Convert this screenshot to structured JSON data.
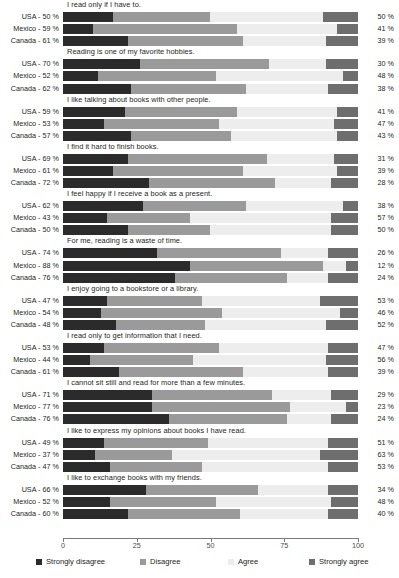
{
  "chart_data": {
    "type": "bar",
    "subtype": "stacked-horizontal-diverging-likert",
    "title": "",
    "xlabel": "",
    "ylabel": "",
    "xlim": [
      0,
      100
    ],
    "xticks": [
      0,
      25,
      50,
      75,
      100
    ],
    "xtick_labels": [
      "0",
      "25",
      "50",
      "75",
      "100"
    ],
    "grid": false,
    "legend_position": "bottom",
    "legend": [
      {
        "key": "strongly_disagree",
        "label": "Strongly disagree",
        "color": "#2b2b2b"
      },
      {
        "key": "disagree",
        "label": "Disagree",
        "color": "#9a9a9a"
      },
      {
        "key": "agree",
        "label": "Agree",
        "color": "#ededed"
      },
      {
        "key": "strongly_agree",
        "label": "Strongly agree",
        "color": "#6e6e6e"
      }
    ],
    "categories": [
      "Strongly disagree",
      "Disagree",
      "Agree",
      "Strongly agree"
    ],
    "countries": [
      "USA",
      "Mexico",
      "Canada"
    ],
    "groups": [
      {
        "statement": "I read only if I have to.",
        "rows": [
          {
            "country": "USA",
            "left_label": "USA - 50 %",
            "right_label": "50 %",
            "disagree_total": 50,
            "agree_total": 50,
            "values": [
              17,
              33,
              38,
              12
            ]
          },
          {
            "country": "Mexico",
            "left_label": "Mexico - 59 %",
            "right_label": "41 %",
            "disagree_total": 59,
            "agree_total": 41,
            "values": [
              10,
              49,
              34,
              7
            ]
          },
          {
            "country": "Canada",
            "left_label": "Canada - 61 %",
            "right_label": "39 %",
            "disagree_total": 61,
            "agree_total": 39,
            "values": [
              22,
              39,
              28,
              11
            ]
          }
        ]
      },
      {
        "statement": "Reading is one of my favorite hobbies.",
        "rows": [
          {
            "country": "USA",
            "left_label": "USA - 70 %",
            "right_label": "30 %",
            "disagree_total": 70,
            "agree_total": 30,
            "values": [
              26,
              44,
              19,
              11
            ]
          },
          {
            "country": "Mexico",
            "left_label": "Mexico - 52 %",
            "right_label": "48 %",
            "disagree_total": 52,
            "agree_total": 48,
            "values": [
              12,
              40,
              43,
              5
            ]
          },
          {
            "country": "Canada",
            "left_label": "Canada - 62 %",
            "right_label": "38 %",
            "disagree_total": 62,
            "agree_total": 38,
            "values": [
              23,
              39,
              28,
              10
            ]
          }
        ]
      },
      {
        "statement": "I like talking about books with other people.",
        "rows": [
          {
            "country": "USA",
            "left_label": "USA - 59 %",
            "right_label": "41 %",
            "disagree_total": 59,
            "agree_total": 41,
            "values": [
              21,
              38,
              34,
              7
            ]
          },
          {
            "country": "Mexico",
            "left_label": "Mexico - 53 %",
            "right_label": "47 %",
            "disagree_total": 53,
            "agree_total": 47,
            "values": [
              14,
              39,
              39,
              8
            ]
          },
          {
            "country": "Canada",
            "left_label": "Canada - 57 %",
            "right_label": "43 %",
            "disagree_total": 57,
            "agree_total": 43,
            "values": [
              23,
              34,
              36,
              7
            ]
          }
        ]
      },
      {
        "statement": "I find it hard to finish books.",
        "rows": [
          {
            "country": "USA",
            "left_label": "USA - 69 %",
            "right_label": "31 %",
            "disagree_total": 69,
            "agree_total": 31,
            "values": [
              22,
              47,
              23,
              8
            ]
          },
          {
            "country": "Mexico",
            "left_label": "Mexico - 61 %",
            "right_label": "39 %",
            "disagree_total": 61,
            "agree_total": 39,
            "values": [
              17,
              44,
              32,
              7
            ]
          },
          {
            "country": "Canada",
            "left_label": "Canada - 72 %",
            "right_label": "28 %",
            "disagree_total": 72,
            "agree_total": 28,
            "values": [
              29,
              43,
              19,
              9
            ]
          }
        ]
      },
      {
        "statement": "I feel happy if I receive a book as a present.",
        "rows": [
          {
            "country": "USA",
            "left_label": "USA - 62 %",
            "right_label": "38 %",
            "disagree_total": 62,
            "agree_total": 38,
            "values": [
              27,
              35,
              33,
              5
            ]
          },
          {
            "country": "Mexico",
            "left_label": "Mexico - 43 %",
            "right_label": "57 %",
            "disagree_total": 43,
            "agree_total": 57,
            "values": [
              15,
              28,
              48,
              9
            ]
          },
          {
            "country": "Canada",
            "left_label": "Canada - 50 %",
            "right_label": "50 %",
            "disagree_total": 50,
            "agree_total": 50,
            "values": [
              22,
              28,
              41,
              9
            ]
          }
        ]
      },
      {
        "statement": "For me, reading is a waste of time.",
        "rows": [
          {
            "country": "USA",
            "left_label": "USA - 74 %",
            "right_label": "26 %",
            "disagree_total": 74,
            "agree_total": 26,
            "values": [
              32,
              42,
              16,
              10
            ]
          },
          {
            "country": "Mexico",
            "left_label": "Mexico - 88 %",
            "right_label": "12 %",
            "disagree_total": 88,
            "agree_total": 12,
            "values": [
              43,
              45,
              8,
              4
            ]
          },
          {
            "country": "Canada",
            "left_label": "Canada - 76 %",
            "right_label": "24 %",
            "disagree_total": 76,
            "agree_total": 24,
            "values": [
              38,
              38,
              14,
              10
            ]
          }
        ]
      },
      {
        "statement": "I enjoy going to a bookstore or a library.",
        "rows": [
          {
            "country": "USA",
            "left_label": "USA - 47 %",
            "right_label": "53 %",
            "disagree_total": 47,
            "agree_total": 53,
            "values": [
              15,
              32,
              40,
              13
            ]
          },
          {
            "country": "Mexico",
            "left_label": "Mexico - 54 %",
            "right_label": "46 %",
            "disagree_total": 54,
            "agree_total": 46,
            "values": [
              13,
              41,
              40,
              6
            ]
          },
          {
            "country": "Canada",
            "left_label": "Canada - 48 %",
            "right_label": "52 %",
            "disagree_total": 48,
            "agree_total": 52,
            "values": [
              18,
              30,
              41,
              11
            ]
          }
        ]
      },
      {
        "statement": "I read only to get information that I need.",
        "rows": [
          {
            "country": "USA",
            "left_label": "USA - 53 %",
            "right_label": "47 %",
            "disagree_total": 53,
            "agree_total": 47,
            "values": [
              14,
              39,
              37,
              10
            ]
          },
          {
            "country": "Mexico",
            "left_label": "Mexico - 44 %",
            "right_label": "56 %",
            "disagree_total": 44,
            "agree_total": 56,
            "values": [
              9,
              35,
              45,
              11
            ]
          },
          {
            "country": "Canada",
            "left_label": "Canada - 61 %",
            "right_label": "39 %",
            "disagree_total": 61,
            "agree_total": 39,
            "values": [
              19,
              42,
              29,
              10
            ]
          }
        ]
      },
      {
        "statement": "I cannot sit still and read for more than a few minutes.",
        "rows": [
          {
            "country": "USA",
            "left_label": "USA - 71 %",
            "right_label": "29 %",
            "disagree_total": 71,
            "agree_total": 29,
            "values": [
              30,
              41,
              20,
              9
            ]
          },
          {
            "country": "Mexico",
            "left_label": "Mexico - 77 %",
            "right_label": "23 %",
            "disagree_total": 77,
            "agree_total": 23,
            "values": [
              30,
              47,
              19,
              4
            ]
          },
          {
            "country": "Canada",
            "left_label": "Canada - 76 %",
            "right_label": "24 %",
            "disagree_total": 76,
            "agree_total": 24,
            "values": [
              36,
              40,
              15,
              9
            ]
          }
        ]
      },
      {
        "statement": "I like to express my opinions about books I have read.",
        "rows": [
          {
            "country": "USA",
            "left_label": "USA - 49 %",
            "right_label": "51 %",
            "disagree_total": 49,
            "agree_total": 51,
            "values": [
              14,
              35,
              41,
              10
            ]
          },
          {
            "country": "Mexico",
            "left_label": "Mexico - 37 %",
            "right_label": "63 %",
            "disagree_total": 37,
            "agree_total": 63,
            "values": [
              11,
              26,
              50,
              13
            ]
          },
          {
            "country": "Canada",
            "left_label": "Canada - 47 %",
            "right_label": "53 %",
            "disagree_total": 47,
            "agree_total": 53,
            "values": [
              16,
              31,
              43,
              10
            ]
          }
        ]
      },
      {
        "statement": "I like to exchange books with my friends.",
        "rows": [
          {
            "country": "USA",
            "left_label": "USA - 66 %",
            "right_label": "34 %",
            "disagree_total": 66,
            "agree_total": 34,
            "values": [
              28,
              38,
              24,
              10
            ]
          },
          {
            "country": "Mexico",
            "left_label": "Mexico - 52 %",
            "right_label": "48 %",
            "disagree_total": 52,
            "agree_total": 48,
            "values": [
              16,
              36,
              39,
              9
            ]
          },
          {
            "country": "Canada",
            "left_label": "Canada - 60 %",
            "right_label": "40 %",
            "disagree_total": 60,
            "agree_total": 40,
            "values": [
              22,
              38,
              30,
              10
            ]
          }
        ]
      }
    ]
  }
}
